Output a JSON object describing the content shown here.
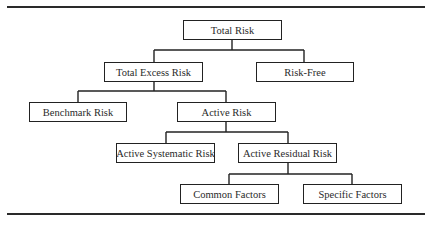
{
  "diagram": {
    "type": "hierarchy-tree",
    "nodes": [
      {
        "id": "total-risk",
        "label": "Total Risk",
        "parent": null
      },
      {
        "id": "total-excess-risk",
        "label": "Total Excess Risk",
        "parent": "total-risk"
      },
      {
        "id": "risk-free",
        "label": "Risk-Free",
        "parent": "total-risk"
      },
      {
        "id": "benchmark-risk",
        "label": "Benchmark Risk",
        "parent": "total-excess-risk"
      },
      {
        "id": "active-risk",
        "label": "Active Risk",
        "parent": "total-excess-risk"
      },
      {
        "id": "active-systematic-risk",
        "label": "Active Systematic Risk",
        "parent": "active-risk"
      },
      {
        "id": "active-residual-risk",
        "label": "Active Residual Risk",
        "parent": "active-risk"
      },
      {
        "id": "common-factors",
        "label": "Common Factors",
        "parent": "active-residual-risk"
      },
      {
        "id": "specific-factors",
        "label": "Specific Factors",
        "parent": "active-residual-risk"
      }
    ]
  }
}
